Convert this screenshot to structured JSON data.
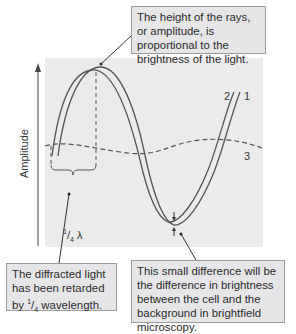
{
  "diagram": {
    "y_axis_label": "Amplitude",
    "curve_labels": {
      "ray2": "2",
      "ray1": "1",
      "ray3": "3"
    },
    "quarter_wavelength": {
      "numerator": "1",
      "denominator": "4",
      "symbol": "λ"
    },
    "callouts": {
      "top": "The height of the rays, or amplitude, is proportional to the brightness of the light.",
      "left_line1": "The diffracted light has been retarded by",
      "left_num": "1",
      "left_den": "4",
      "left_line2": " wavelength.",
      "right": "This small difference will be the difference in brightness between the cell and the background in brightfield microscopy."
    },
    "colors": {
      "plot_bg": "#ebebec",
      "callout_bg": "#e6e6e8",
      "curve": "#555555",
      "text": "#2a2a2a"
    }
  }
}
